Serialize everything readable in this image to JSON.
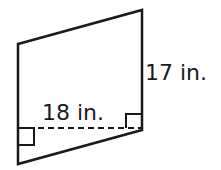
{
  "figure": {
    "shape": "parallelogram",
    "base_label": "18 in.",
    "height_label": "17 in.",
    "stroke_color": "#1a1a1a"
  }
}
